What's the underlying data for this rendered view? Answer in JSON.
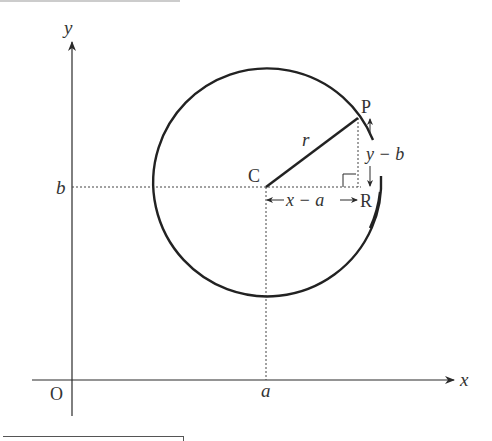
{
  "diagram": {
    "type": "circle-equation-derivation",
    "axes": {
      "x_label": "x",
      "y_label": "y",
      "origin_label": "O"
    },
    "ticks": {
      "x_tick": "a",
      "y_tick": "b"
    },
    "points": {
      "center": "C",
      "point_on_circle": "P",
      "right_angle_point": "R"
    },
    "radius_label": "r",
    "horizontal_distance_label": "x − a",
    "vertical_distance_label": "y − b",
    "colors": {
      "stroke": "#2a2a2a",
      "dotted": "#444444",
      "background": "#ffffff"
    }
  }
}
